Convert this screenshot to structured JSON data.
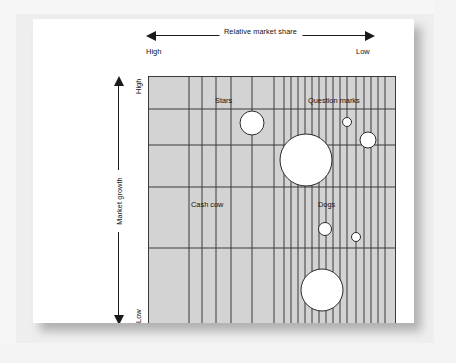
{
  "figure": {
    "kind": "bcg-growth-share-matrix",
    "background_color": "#eeeeee",
    "card_color": "#ffffff",
    "plot_fill": "#d3d3d3",
    "grid_line_color": "#3a3a3a",
    "bubble_fill": "#ffffff",
    "bubble_stroke": "#2b2b2b"
  },
  "axes": {
    "top": {
      "caption": "Relative market share",
      "left_label": "High",
      "right_label": "Low",
      "arrow": "double"
    },
    "left": {
      "caption": "Market growth",
      "top_label": "High",
      "bottom_label": "Low",
      "arrow": "double"
    }
  },
  "quadrants": [
    {
      "key": "stars",
      "label": "Stars",
      "x": 66,
      "y": 19
    },
    {
      "key": "question-marks",
      "label": "Question marks",
      "x": 159,
      "y": 19
    },
    {
      "key": "cash-cow",
      "label": "Cash cow",
      "x": 42,
      "y": 123
    },
    {
      "key": "dogs",
      "label": "Dogs",
      "x": 169,
      "y": 123
    }
  ],
  "chart_data": {
    "type": "scatter",
    "title": "",
    "xlabel": "Relative market share",
    "ylabel": "Market growth",
    "xlim": [
      0,
      248
    ],
    "ylim": [
      0,
      249
    ],
    "grid": true,
    "legend": false,
    "vertical_gridlines": [
      40,
      53,
      67,
      82,
      103,
      125,
      135,
      142,
      149,
      156,
      163,
      170,
      177,
      184,
      191,
      198,
      207,
      215,
      222,
      229,
      236
    ],
    "horizontal_gridlines": [
      32,
      68,
      110,
      171
    ],
    "bubbles": [
      {
        "name": "star-bubble-1",
        "quadrant": "stars",
        "cx": 103,
        "cy": 46,
        "r": 12
      },
      {
        "name": "question-bubble-large",
        "quadrant": "question-marks",
        "cx": 157,
        "cy": 83,
        "r": 26
      },
      {
        "name": "question-bubble-small",
        "quadrant": "question-marks",
        "cx": 198,
        "cy": 45,
        "r": 4.5
      },
      {
        "name": "question-bubble-medium",
        "quadrant": "question-marks",
        "cx": 219,
        "cy": 63,
        "r": 8
      },
      {
        "name": "dog-bubble-medium",
        "quadrant": "dogs",
        "cx": 176,
        "cy": 152,
        "r": 6.5
      },
      {
        "name": "dog-bubble-small",
        "quadrant": "dogs",
        "cx": 207,
        "cy": 160,
        "r": 4.5
      },
      {
        "name": "dog-bubble-large",
        "quadrant": "dogs",
        "cx": 173,
        "cy": 213,
        "r": 21
      }
    ]
  }
}
